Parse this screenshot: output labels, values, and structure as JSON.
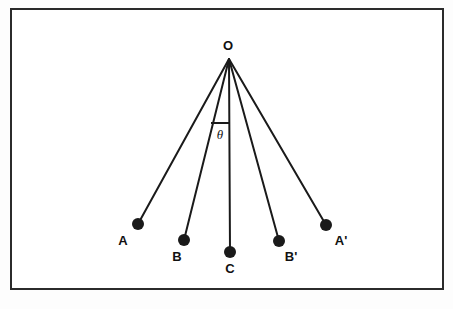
{
  "figure": {
    "background_color": "#fdfdfd",
    "stroke_color": "#1a1a1a",
    "border": {
      "name": "figure-border",
      "x": 11,
      "y": 9,
      "width": 432,
      "height": 280,
      "stroke_width": 2,
      "color": "#2b2b2b"
    },
    "pivot": {
      "label": "O",
      "x": 229,
      "y": 59,
      "label_x": 228,
      "label_y": 50
    },
    "angle": {
      "label": "θ",
      "label_x": 220,
      "label_y": 139,
      "tick_x1": 211,
      "tick_y1": 123,
      "tick_x2": 229,
      "tick_y2": 123
    },
    "bob_radius": 6,
    "line_width": 2,
    "points": [
      {
        "label": "A",
        "x": 138,
        "y": 224,
        "label_x": 123,
        "label_y": 245,
        "prime": false
      },
      {
        "label": "B",
        "x": 184,
        "y": 240,
        "label_x": 177,
        "label_y": 261,
        "prime": false
      },
      {
        "label": "C",
        "x": 230,
        "y": 252,
        "label_x": 230,
        "label_y": 273,
        "prime": false
      },
      {
        "label": "B'",
        "x": 279,
        "y": 241,
        "label_x": 291,
        "label_y": 261,
        "prime": true
      },
      {
        "label": "A'",
        "x": 326,
        "y": 225,
        "label_x": 341,
        "label_y": 245,
        "prime": true
      }
    ]
  },
  "chart_data": {
    "type": "diagram",
    "pivot": "O",
    "bobs": [
      "A",
      "B",
      "C",
      "B'",
      "A'"
    ],
    "angle_label": "θ",
    "x": [
      138,
      184,
      230,
      279,
      326
    ],
    "y": [
      224,
      240,
      252,
      241,
      225
    ],
    "xlabel": "",
    "ylabel": "",
    "grid": false,
    "legend": "none"
  }
}
